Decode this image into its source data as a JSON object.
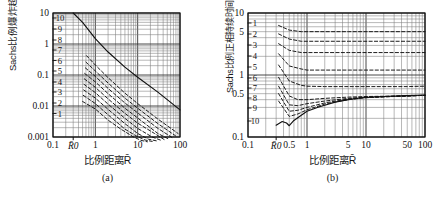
{
  "figure": {
    "background": "#ffffff",
    "line_color": "#111111",
    "grid_color": "#4a4a4a",
    "minor_grid_color": "#8a8a8a"
  },
  "panels": [
    {
      "id": "a",
      "caption": "(a)",
      "ylabel": "Sachs比例爆炸超压",
      "xlabel": "比例距离R̄",
      "r0_label": "R̄0",
      "x_ticks": [
        "0.1",
        "1",
        "10",
        "100"
      ],
      "y_ticks": [
        "10",
        "1",
        "0.1",
        "0.01",
        "0.001"
      ],
      "curve_labels": [
        "10",
        "9",
        "8",
        "7",
        "6",
        "5",
        "4",
        "3",
        "2",
        "1"
      ],
      "chart_data": {
        "type": "line",
        "title": "",
        "xlabel": "比例距离R̄",
        "ylabel": "Sachs比例爆炸超压",
        "xscale": "log",
        "yscale": "log",
        "xlim": [
          0.1,
          100
        ],
        "ylim": [
          0.001,
          10
        ],
        "grid": true,
        "legend": "inline-left-edge",
        "r0": 0.3,
        "series": [
          {
            "name": "10",
            "style": "solid",
            "x": [
              0.3,
              0.5,
              0.8,
              1.0,
              2.0,
              5.0,
              10.0,
              30.0,
              100.0
            ],
            "y": [
              10.0,
              5.0,
              2.2,
              1.5,
              0.55,
              0.18,
              0.085,
              0.028,
              0.0075
            ]
          },
          {
            "name": "9",
            "style": "dashed",
            "x": [
              0.62,
              1.0,
              2.0,
              5.0,
              10.0,
              30.0,
              90.0
            ],
            "y": [
              0.42,
              0.21,
              0.082,
              0.026,
              0.012,
              0.0038,
              0.0013
            ]
          },
          {
            "name": "8",
            "style": "dashed",
            "x": [
              0.6,
              1.0,
              2.0,
              5.0,
              10.0,
              30.0,
              78.0
            ],
            "y": [
              0.26,
              0.135,
              0.055,
              0.018,
              0.0085,
              0.0027,
              0.0011
            ]
          },
          {
            "name": "7",
            "style": "dashed",
            "x": [
              0.58,
              1.0,
              2.0,
              5.0,
              10.0,
              30.0,
              66.0
            ],
            "y": [
              0.17,
              0.09,
              0.037,
              0.0125,
              0.006,
              0.0019,
              0.00095
            ]
          },
          {
            "name": "6",
            "style": "dashed",
            "x": [
              0.56,
              1.0,
              2.0,
              5.0,
              10.0,
              30.0,
              55.0
            ],
            "y": [
              0.112,
              0.06,
              0.025,
              0.0085,
              0.0041,
              0.0013,
              0.00085
            ]
          },
          {
            "name": "5",
            "style": "dashed",
            "x": [
              0.55,
              1.0,
              2.0,
              5.0,
              10.0,
              25.0,
              44.0
            ],
            "y": [
              0.075,
              0.04,
              0.017,
              0.0058,
              0.0028,
              0.0013,
              0.0008
            ]
          },
          {
            "name": "4",
            "style": "dashed",
            "x": [
              0.54,
              1.0,
              2.0,
              5.0,
              10.0,
              22.0,
              36.0
            ],
            "y": [
              0.05,
              0.027,
              0.0115,
              0.004,
              0.0019,
              0.001,
              0.00078
            ]
          },
          {
            "name": "3",
            "style": "dashed",
            "x": [
              0.53,
              1.0,
              2.0,
              5.0,
              10.0,
              18.0,
              28.0
            ],
            "y": [
              0.033,
              0.018,
              0.0078,
              0.0027,
              0.0013,
              0.00085,
              0.00075
            ]
          },
          {
            "name": "2",
            "style": "dashed",
            "x": [
              0.52,
              1.0,
              2.0,
              5.0,
              9.0,
              15.0,
              22.0
            ],
            "y": [
              0.022,
              0.012,
              0.0052,
              0.0018,
              0.0011,
              0.0008,
              0.00072
            ]
          },
          {
            "name": "1",
            "style": "dashed",
            "x": [
              0.5,
              1.0,
              2.0,
              4.0,
              8.0,
              12.0,
              17.0
            ],
            "y": [
              0.014,
              0.008,
              0.0035,
              0.0018,
              0.001,
              0.00078,
              0.0007
            ]
          }
        ]
      }
    },
    {
      "id": "b",
      "caption": "(b)",
      "ylabel": "Sachs比例正相持续时间（无量纲）",
      "xlabel": "比例距离R̄",
      "r0_label": "R̄0",
      "x_ticks": [
        "0.1",
        "0.5",
        "1",
        "5",
        "10",
        "50",
        "100"
      ],
      "y_ticks": [
        "10",
        "5",
        "1",
        "0.5",
        "0.1"
      ],
      "curve_labels": [
        "1",
        "2",
        "3",
        "4",
        "5",
        "6",
        "7",
        "8",
        "9",
        "10"
      ],
      "chart_data": {
        "type": "line",
        "title": "",
        "xlabel": "比例距离R̄",
        "ylabel": "Sachs比例正相持续时间（无量纲）",
        "xscale": "log",
        "yscale": "log",
        "xlim": [
          0.1,
          100
        ],
        "ylim": [
          0.1,
          10
        ],
        "grid": true,
        "legend": "inline-left-edge",
        "r0": 0.3,
        "series": [
          {
            "name": "1",
            "style": "dashed",
            "x": [
              0.33,
              0.5,
              0.8,
              1.0,
              2.0,
              5.0,
              10.0,
              50.0,
              100.0
            ],
            "y": [
              6.3,
              5.3,
              5.0,
              5.0,
              5.0,
              5.0,
              5.0,
              5.0,
              5.0
            ]
          },
          {
            "name": "2",
            "style": "dashed",
            "x": [
              0.33,
              0.5,
              0.8,
              1.0,
              2.0,
              5.0,
              10.0,
              50.0,
              100.0
            ],
            "y": [
              4.6,
              3.8,
              3.5,
              3.5,
              3.5,
              3.5,
              3.5,
              3.5,
              3.5
            ]
          },
          {
            "name": "3",
            "style": "dashed",
            "x": [
              0.33,
              0.5,
              0.8,
              1.0,
              2.0,
              5.0,
              10.0,
              50.0,
              100.0
            ],
            "y": [
              3.2,
              2.5,
              2.3,
              2.3,
              2.3,
              2.3,
              2.3,
              2.3,
              2.3
            ]
          },
          {
            "name": "4",
            "style": "dashed",
            "x": [
              0.33,
              0.5,
              0.8,
              1.0,
              2.0,
              5.0,
              10.0,
              50.0,
              100.0
            ],
            "y": [
              2.2,
              1.4,
              1.25,
              1.2,
              1.2,
              1.2,
              1.2,
              1.2,
              1.2
            ]
          },
          {
            "name": "5",
            "style": "dashed",
            "x": [
              0.33,
              0.5,
              0.8,
              1.0,
              2.0,
              5.0,
              10.0,
              50.0,
              100.0
            ],
            "y": [
              1.45,
              0.8,
              0.68,
              0.66,
              0.65,
              0.65,
              0.65,
              0.65,
              0.66
            ]
          },
          {
            "name": "6",
            "style": "dashed",
            "x": [
              0.33,
              0.5,
              0.7,
              1.0,
              2.0,
              5.0,
              10.0,
              50.0,
              100.0
            ],
            "y": [
              0.92,
              0.46,
              0.4,
              0.4,
              0.42,
              0.44,
              0.45,
              0.46,
              0.47
            ]
          },
          {
            "name": "7",
            "style": "dashed",
            "x": [
              0.33,
              0.5,
              0.7,
              1.0,
              2.0,
              5.0,
              10.0,
              50.0,
              100.0
            ],
            "y": [
              0.66,
              0.33,
              0.32,
              0.345,
              0.38,
              0.42,
              0.44,
              0.46,
              0.47
            ]
          },
          {
            "name": "8",
            "style": "dashed",
            "x": [
              0.33,
              0.5,
              0.7,
              1.0,
              2.0,
              5.0,
              10.0,
              50.0,
              100.0
            ],
            "y": [
              0.5,
              0.26,
              0.27,
              0.3,
              0.355,
              0.41,
              0.435,
              0.46,
              0.47
            ]
          },
          {
            "name": "9",
            "style": "dashed",
            "x": [
              0.33,
              0.5,
              0.7,
              1.0,
              2.0,
              5.0,
              10.0,
              50.0,
              100.0
            ],
            "y": [
              0.38,
              0.215,
              0.235,
              0.275,
              0.34,
              0.4,
              0.43,
              0.46,
              0.47
            ]
          },
          {
            "name": "10",
            "style": "solid",
            "x": [
              0.3,
              0.38,
              0.45,
              0.5,
              0.6,
              0.8,
              1.0,
              1.5,
              2.0,
              3.0,
              5.0,
              8.0,
              10.0,
              20.0,
              50.0,
              100.0
            ],
            "y": [
              0.155,
              0.178,
              0.168,
              0.152,
              0.185,
              0.225,
              0.26,
              0.3,
              0.325,
              0.365,
              0.4,
              0.425,
              0.435,
              0.45,
              0.465,
              0.475
            ]
          }
        ]
      }
    }
  ]
}
